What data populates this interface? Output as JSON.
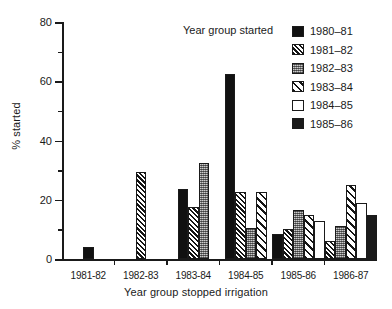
{
  "chart_data": {
    "type": "bar",
    "title": "",
    "xlabel": "Year group stopped irrigation",
    "ylabel": "% started",
    "ylim": [
      0,
      80
    ],
    "yticks": [
      0,
      20,
      40,
      60,
      80
    ],
    "yticks_minor": [
      10,
      30,
      50,
      70
    ],
    "grid": false,
    "legend_position": "top-right",
    "legend_title": "Year group started",
    "categories": [
      "1981-82",
      "1982-83",
      "1983-84",
      "1984-85",
      "1985-86",
      "1986-87"
    ],
    "series": [
      {
        "name": "1980–81",
        "pattern": "solid-black",
        "values": [
          4.0,
          null,
          23.5,
          62.5,
          8.5,
          null
        ]
      },
      {
        "name": "1981–82",
        "pattern": "diagonal-hatch-dense",
        "values": [
          null,
          29.5,
          17.5,
          22.5,
          10.0,
          6.0
        ]
      },
      {
        "name": "1982–83",
        "pattern": "gray-stipple",
        "values": [
          null,
          null,
          32.5,
          10.5,
          16.5,
          11.0
        ]
      },
      {
        "name": "1983–84",
        "pattern": "diagonal-hatch-wide",
        "values": [
          null,
          null,
          null,
          22.5,
          15.0,
          25.0
        ]
      },
      {
        "name": "1984–85",
        "pattern": "white-empty",
        "values": [
          null,
          null,
          null,
          null,
          13.0,
          19.0
        ]
      },
      {
        "name": "1985–86",
        "pattern": "solid-black-2",
        "values": [
          null,
          null,
          null,
          null,
          null,
          15.0
        ]
      }
    ]
  },
  "legend": {
    "title": "Year group started",
    "items": [
      {
        "label": "1980–81",
        "swatch": "solid-black"
      },
      {
        "label": "1981–82",
        "swatch": "diagonal-hatch-dense"
      },
      {
        "label": "1982–83",
        "swatch": "gray-stipple"
      },
      {
        "label": "1983–84",
        "swatch": "diagonal-hatch-wide"
      },
      {
        "label": "1984–85",
        "swatch": "white-empty"
      },
      {
        "label": "1985–86",
        "swatch": "solid-black-2"
      }
    ]
  },
  "colors": {
    "ink": "#1a1a1a",
    "background": "#ffffff",
    "stipple_gray": "#8e8e8e"
  }
}
